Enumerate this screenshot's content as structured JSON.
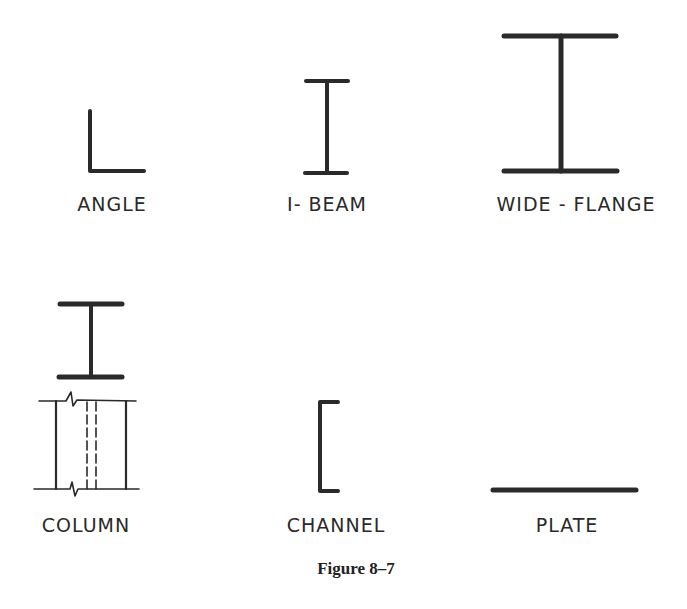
{
  "figure": {
    "caption": "Figure 8–7",
    "ink_color": "#2a2a2a",
    "shapes": [
      {
        "id": "angle",
        "label": "ANGLE",
        "icon": "angle-section-icon"
      },
      {
        "id": "i-beam",
        "label": "I- BEAM",
        "icon": "i-beam-section-icon"
      },
      {
        "id": "wide-flange",
        "label": "WIDE - FLANGE",
        "icon": "wide-flange-section-icon"
      },
      {
        "id": "column",
        "label": "COLUMN",
        "icon": "column-section-icon"
      },
      {
        "id": "channel",
        "label": "CHANNEL",
        "icon": "channel-section-icon"
      },
      {
        "id": "plate",
        "label": "PLATE",
        "icon": "plate-section-icon"
      }
    ]
  }
}
